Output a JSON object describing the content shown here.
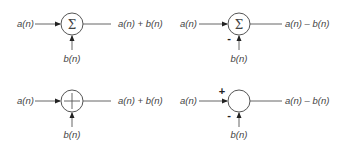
{
  "diagram": {
    "title": "",
    "colors": {
      "stroke": "#555555",
      "text": "#444444",
      "arrowhead": "#222222",
      "background": "#ffffff"
    },
    "blocks": [
      {
        "id": "sum-sigma-add",
        "symbol": "Σ",
        "input_a": "a(n)",
        "input_b": "b(n)",
        "sign_a": "",
        "sign_b": "",
        "output": "a(n) + b(n)"
      },
      {
        "id": "sum-sigma-subtract",
        "symbol": "Σ",
        "input_a": "a(n)",
        "input_b": "b(n)",
        "sign_a": "",
        "sign_b": "-",
        "output": "a(n) – b(n)"
      },
      {
        "id": "sum-plus-add",
        "symbol": "+",
        "input_a": "a(n)",
        "input_b": "b(n)",
        "sign_a": "",
        "sign_b": "",
        "output": "a(n) + b(n)"
      },
      {
        "id": "sum-empty-subtract",
        "symbol": "",
        "input_a": "a(n)",
        "input_b": "b(n)",
        "sign_a": "+",
        "sign_b": "-",
        "output": "a(n) – b(n)"
      }
    ]
  }
}
